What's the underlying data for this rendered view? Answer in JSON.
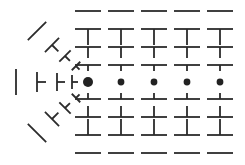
{
  "figure": {
    "type": "vector-line-element-field",
    "background_color": "#ffffff",
    "stroke_color": "#2b2b2b",
    "dot_color": "#222222",
    "width": 245,
    "height": 165
  },
  "center_point": {
    "name": "singular-point",
    "x": 88,
    "y": 82,
    "radius": 5.0
  },
  "row_dots": [
    {
      "x": 88,
      "y": 82,
      "r": 5.0
    },
    {
      "x": 121,
      "y": 82,
      "r": 3.4
    },
    {
      "x": 154,
      "y": 82,
      "r": 3.4
    },
    {
      "x": 187,
      "y": 82,
      "r": 3.4
    },
    {
      "x": 220,
      "y": 82,
      "r": 3.4
    }
  ],
  "grid": {
    "columns_x": [
      88,
      121,
      154,
      187,
      220
    ],
    "rows_y": [
      11,
      29,
      47,
      65,
      82,
      99,
      117,
      135,
      153
    ],
    "bar_half_length": 13,
    "row_stems": [
      0,
      16,
      11,
      6,
      0,
      6,
      11,
      16,
      0
    ],
    "row_stem_side": [
      "none",
      "down",
      "down",
      "down",
      "none",
      "up",
      "up",
      "up",
      "none"
    ],
    "row_bar_angle_deg": [
      0,
      0,
      0,
      0,
      0,
      0,
      0,
      0,
      0
    ]
  },
  "left_elements": [
    {
      "name": "element-upper-left-far",
      "cx": 37,
      "cy": 31,
      "angle_deg": 135,
      "bar_half": 13,
      "stem": 0
    },
    {
      "name": "element-upper-left-mid",
      "cx": 52,
      "cy": 45,
      "angle_deg": 135,
      "bar_half": 10,
      "stem": 9
    },
    {
      "name": "element-upper-left-near",
      "cx": 65,
      "cy": 56,
      "angle_deg": 135,
      "bar_half": 8,
      "stem": 7
    },
    {
      "name": "element-upper-left-inner",
      "cx": 76,
      "cy": 66,
      "angle_deg": 135,
      "bar_half": 6,
      "stem": 5
    },
    {
      "name": "element-left-far",
      "cx": 16,
      "cy": 82,
      "angle_deg": 90,
      "bar_half": 13,
      "stem": 0
    },
    {
      "name": "element-left-mid",
      "cx": 37,
      "cy": 82,
      "angle_deg": 90,
      "bar_half": 10,
      "stem": 9
    },
    {
      "name": "element-left-near",
      "cx": 57,
      "cy": 82,
      "angle_deg": 90,
      "bar_half": 9,
      "stem": 8
    },
    {
      "name": "element-left-inner",
      "cx": 72,
      "cy": 82,
      "angle_deg": 90,
      "bar_half": 7,
      "stem": 6
    },
    {
      "name": "element-lower-left-inner",
      "cx": 76,
      "cy": 98,
      "angle_deg": 45,
      "bar_half": 6,
      "stem": 5
    },
    {
      "name": "element-lower-left-near",
      "cx": 65,
      "cy": 108,
      "angle_deg": 45,
      "bar_half": 8,
      "stem": 7
    },
    {
      "name": "element-lower-left-mid",
      "cx": 52,
      "cy": 119,
      "angle_deg": 45,
      "bar_half": 10,
      "stem": 9
    },
    {
      "name": "element-lower-left-far",
      "cx": 37,
      "cy": 133,
      "angle_deg": 45,
      "bar_half": 13,
      "stem": 0
    }
  ],
  "legend": {
    "stroke_width": 1.8,
    "stem_width": 1.8
  }
}
